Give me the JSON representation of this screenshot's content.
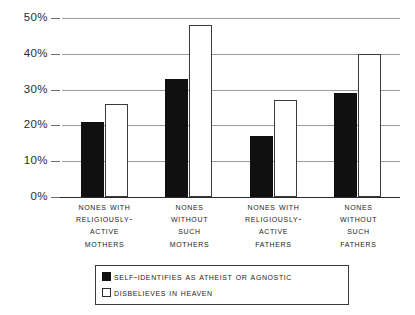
{
  "chart_data": {
    "type": "bar",
    "title": "",
    "xlabel": "",
    "ylabel": "",
    "ylim": [
      0,
      50
    ],
    "grid": true,
    "legend_position": "bottom",
    "ytick_labels": [
      "50%",
      "40%",
      "30%",
      "20%",
      "10%",
      "0%"
    ],
    "ytick_values": [
      50,
      40,
      30,
      20,
      10,
      0
    ],
    "categories": [
      "Nones with religiously-active mothers",
      "Nones without such mothers",
      "Nones with religiously-active fathers",
      "Nones without such fathers"
    ],
    "category_lines": [
      [
        "Nones with",
        "religiously-",
        "active",
        "mothers"
      ],
      [
        "Nones",
        "without",
        "such",
        "mothers"
      ],
      [
        "Nones with",
        "religiously-",
        "active",
        "fathers"
      ],
      [
        "Nones",
        "without",
        "such",
        "fathers"
      ]
    ],
    "series": [
      {
        "name": "Self-identifies as atheist or agnostic",
        "style": "filled-black",
        "color": "#101010",
        "values": [
          21,
          33,
          17,
          29
        ]
      },
      {
        "name": "Disbelieves in heaven",
        "style": "outlined-white",
        "color": "#ffffff",
        "values": [
          26,
          48,
          27,
          40
        ]
      }
    ]
  },
  "legend": {
    "items": [
      {
        "label": "Self-identifies as atheist or agnostic",
        "swatch": "dark"
      },
      {
        "label": "Disbelieves in heaven",
        "swatch": "light"
      }
    ]
  }
}
